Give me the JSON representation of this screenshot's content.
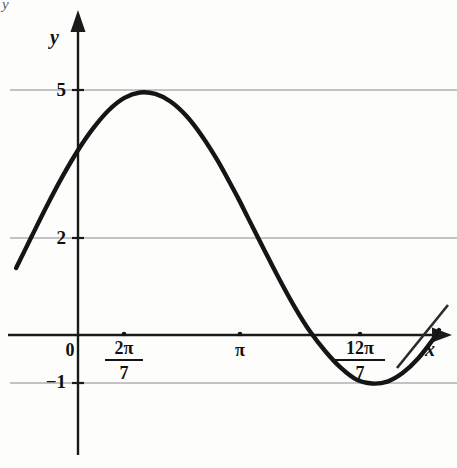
{
  "figure": {
    "background_color": "#fdfdfc",
    "curve_color": "#151515",
    "axis_color": "#1a1a1a",
    "grid_color": "#8a8a8a",
    "corner_artifact": "y"
  },
  "axes": {
    "x_axis_label": "x",
    "y_axis_label": "y",
    "origin_label": "0"
  },
  "y_ticks": [
    {
      "label": "5",
      "value": 5
    },
    {
      "label": "2",
      "value": 2
    },
    {
      "label": "−1",
      "value": -1
    }
  ],
  "x_ticks": [
    {
      "label": "0",
      "numerator": "",
      "denominator": "",
      "is_fraction": false,
      "value": 0
    },
    {
      "label": "2π/7",
      "numerator": "2π",
      "denominator": "7",
      "is_fraction": true,
      "value": 0.8976
    },
    {
      "label": "π",
      "numerator": "",
      "denominator": "",
      "is_fraction": false,
      "value": 3.1416
    },
    {
      "label": "12π/7",
      "numerator": "12π",
      "denominator": "7",
      "is_fraction": true,
      "value": 5.3856
    }
  ],
  "chart_data": {
    "type": "line",
    "title": "",
    "xlabel": "x",
    "ylabel": "y",
    "grid": true,
    "legend": "none",
    "xlim": [
      -1.2,
      7.0
    ],
    "ylim": [
      -2.6,
      5.9
    ],
    "function": "y = 2 + 3*sin((7/10)*(x - 2*pi/7) + pi/2)",
    "midline": 2,
    "amplitude": 3,
    "maximum": {
      "x_label": "2π/7",
      "x": 0.8976,
      "y": 5
    },
    "minimum": {
      "x_label": "12π/7",
      "x": 5.3856,
      "y": -1
    },
    "period_label": "20π/7",
    "y_tick_values": [
      5,
      2,
      -1
    ],
    "x_tick_values": [
      0,
      0.8976,
      3.1416,
      5.3856
    ],
    "x_tick_labels": [
      "0",
      "2π/7",
      "π",
      "12π/7"
    ],
    "points": [
      {
        "x": -1.2,
        "y": 1.38
      },
      {
        "x": -0.9,
        "y": 2.03
      },
      {
        "x": -0.6,
        "y": 2.67
      },
      {
        "x": -0.3,
        "y": 3.27
      },
      {
        "x": 0.0,
        "y": 3.81
      },
      {
        "x": 0.3,
        "y": 4.27
      },
      {
        "x": 0.6,
        "y": 4.64
      },
      {
        "x": 0.9,
        "y": 4.89
      },
      {
        "x": 1.2,
        "y": 5.0
      },
      {
        "x": 1.5,
        "y": 4.97
      },
      {
        "x": 1.8,
        "y": 4.81
      },
      {
        "x": 2.1,
        "y": 4.52
      },
      {
        "x": 2.4,
        "y": 4.11
      },
      {
        "x": 2.7,
        "y": 3.61
      },
      {
        "x": 3.0,
        "y": 3.03
      },
      {
        "x": 3.14,
        "y": 2.75
      },
      {
        "x": 3.3,
        "y": 2.41
      },
      {
        "x": 3.6,
        "y": 1.78
      },
      {
        "x": 3.9,
        "y": 1.16
      },
      {
        "x": 4.2,
        "y": 0.58
      },
      {
        "x": 4.5,
        "y": 0.07
      },
      {
        "x": 4.8,
        "y": -0.34
      },
      {
        "x": 5.1,
        "y": -0.68
      },
      {
        "x": 5.4,
        "y": -0.92
      },
      {
        "x": 5.7,
        "y": -1.0
      },
      {
        "x": 6.0,
        "y": -0.96
      },
      {
        "x": 6.3,
        "y": -0.78
      },
      {
        "x": 6.6,
        "y": -0.48
      },
      {
        "x": 6.9,
        "y": -0.07
      },
      {
        "x": 7.0,
        "y": 0.1
      }
    ]
  }
}
